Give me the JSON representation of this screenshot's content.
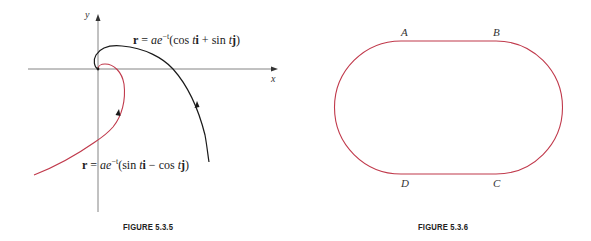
{
  "figures": [
    {
      "caption": "FIGURE 5.3.5",
      "axes": {
        "x_label": "x",
        "y_label": "y"
      },
      "curves": [
        {
          "name": "black-spiral",
          "color": "#1a1a1a",
          "equation": {
            "lhs": "r",
            "eq": " = ",
            "coef": "ae",
            "exp": "−t",
            "open": "(cos ",
            "t1": "t",
            "u1": "i",
            "op": " + ",
            "fn2": "sin ",
            "t2": "t",
            "u2": "j",
            "close": ")"
          }
        },
        {
          "name": "red-spiral",
          "color": "#c0394b",
          "equation": {
            "lhs": "r",
            "eq": " = ",
            "coef": "ae",
            "exp": "−t",
            "open": "(sin ",
            "t1": "t",
            "u1": "i",
            "op": " − ",
            "fn2": "cos ",
            "t2": "t",
            "u2": "j",
            "close": ")"
          }
        }
      ]
    },
    {
      "caption": "FIGURE 5.3.6",
      "shape": "stadium / racetrack",
      "stroke_color": "#c0394b",
      "points": [
        "A",
        "B",
        "C",
        "D"
      ]
    }
  ]
}
